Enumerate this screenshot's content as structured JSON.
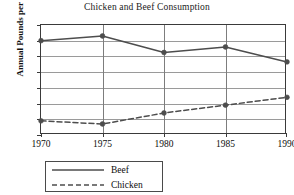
{
  "chart_data": {
    "type": "line",
    "title": "Chicken and Beef Consumption",
    "xlabel": "",
    "ylabel": "Annual Pounds per Person",
    "categories": [
      "1970",
      "1975",
      "1980",
      "1985",
      "1990"
    ],
    "x": [
      1970,
      1975,
      1980,
      1985,
      1990
    ],
    "xlim": [
      1970,
      1990
    ],
    "ylim": [
      20,
      90
    ],
    "yticks": [
      20,
      30,
      40,
      50,
      60,
      70,
      80,
      90
    ],
    "xticks": [
      "1970",
      "1975",
      "1980",
      "1985",
      "1990"
    ],
    "grid": true,
    "legend_position": "below-left",
    "series": [
      {
        "name": "Beef",
        "values": [
          80,
          83,
          72.5,
          76,
          66.5
        ],
        "style": "solid",
        "color": "#4d4d4d",
        "marker": "circle"
      },
      {
        "name": "Chicken",
        "values": [
          29,
          27,
          34,
          39,
          44
        ],
        "style": "dashed",
        "color": "#4d4d4d",
        "marker": "circle"
      }
    ]
  },
  "legend": {
    "items": [
      {
        "label": "Beef"
      },
      {
        "label": "Chicken"
      }
    ]
  },
  "colors": {
    "line": "#4d4d4d",
    "grid": "#9a9a9a",
    "frame": "#3a3a3a",
    "text": "#0d0d0d",
    "background": "#ffffff"
  }
}
